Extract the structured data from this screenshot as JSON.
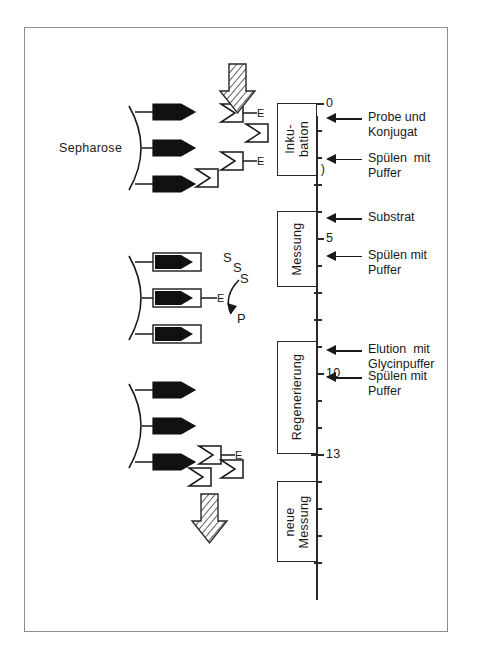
{
  "figure": {
    "kind": "immunoassay-timeline-diagram",
    "background": "#ffffff",
    "ink": "#1a1a1a"
  },
  "axis": {
    "title_line1": "Zeit",
    "title_line2": "( min )",
    "unit": "min",
    "range_min": 0,
    "range_max": 17,
    "labeled_ticks": [
      "0",
      "5",
      "10",
      "13"
    ],
    "tick_values": [
      0,
      1,
      2,
      3,
      4,
      5,
      6,
      7,
      8,
      9,
      10,
      11,
      12,
      13,
      14,
      15,
      16,
      17
    ]
  },
  "phases": [
    {
      "id": "inkubation",
      "label": "Inku-\nbation",
      "start_min": 0.0,
      "end_min": 2.7
    },
    {
      "id": "messung",
      "label": "Messung",
      "start_min": 4.0,
      "end_min": 6.8
    },
    {
      "id": "regenerierung",
      "label": "Regenerierung",
      "start_min": 8.8,
      "end_min": 13.0
    },
    {
      "id": "neue-messung",
      "label": "neue\nMessung",
      "start_min": 14.0,
      "end_min": 17.0
    }
  ],
  "annotations": [
    {
      "id": "probe-konjugat",
      "line1": "Probe und",
      "line2": "Konjugat",
      "at_min": 0.6
    },
    {
      "id": "spuelen-1",
      "line1": "Spülen  mit",
      "line2": "Puffer",
      "at_min": 2.1
    },
    {
      "id": "substrat",
      "line1": "Substrat",
      "line2": "",
      "at_min": 4.3
    },
    {
      "id": "spuelen-2",
      "line1": "Spülen mit",
      "line2": "Puffer",
      "at_min": 5.7
    },
    {
      "id": "elution",
      "line1": "Elution  mit",
      "line2": "Glycinpuffer",
      "at_min": 9.2
    },
    {
      "id": "spuelen-3",
      "line1": "Spülen mit",
      "line2": "Puffer",
      "at_min": 10.2
    }
  ],
  "panels": {
    "sepharose_label": "Sepharose",
    "substrate_symbol": "S",
    "product_symbol": "P",
    "enzyme_symbol": "E",
    "free_substrate_labels": [
      "S",
      "S"
    ],
    "reaction_substrate_label": "S",
    "reaction_product_label": "P"
  }
}
